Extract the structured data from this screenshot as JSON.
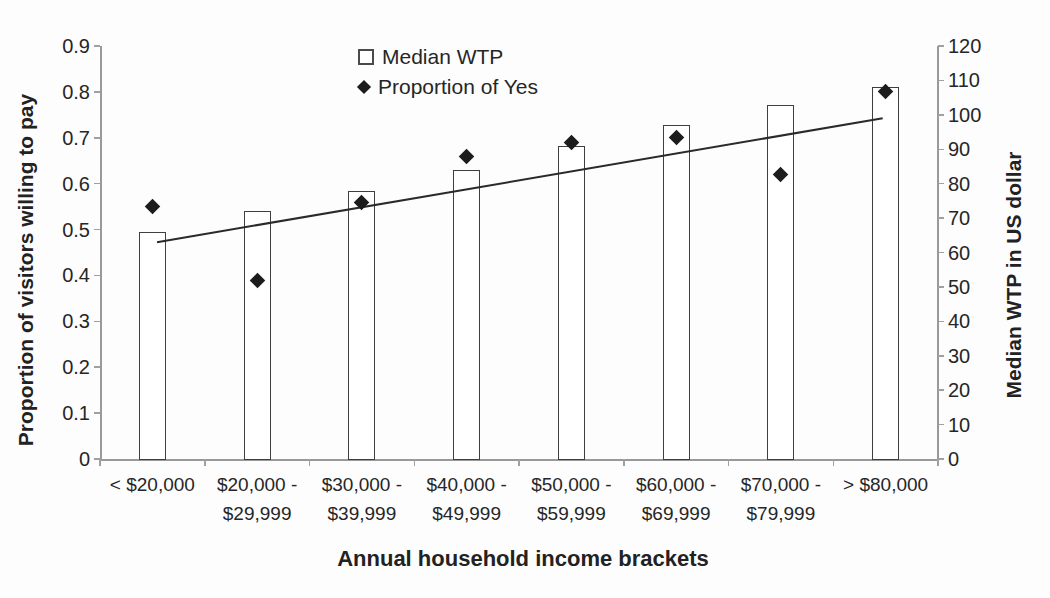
{
  "legend": {
    "items": [
      {
        "marker": "open-square-icon",
        "label": "Median WTP"
      },
      {
        "marker": "filled-diamond-icon",
        "label": "Proportion of Yes"
      }
    ]
  },
  "axes": {
    "left": {
      "title": "Proportion of visitors willing to pay",
      "min": 0,
      "max": 0.9,
      "ticks": [
        "0",
        "0.1",
        "0.2",
        "0.3",
        "0.4",
        "0.5",
        "0.6",
        "0.7",
        "0.8",
        "0.9"
      ]
    },
    "right": {
      "title": "Median WTP in US dollar",
      "min": 0,
      "max": 120,
      "ticks": [
        "0",
        "10",
        "20",
        "30",
        "40",
        "50",
        "60",
        "70",
        "80",
        "90",
        "100",
        "110",
        "120"
      ]
    },
    "x": {
      "title": "Annual household income brackets"
    }
  },
  "chart_data": {
    "type": "bar",
    "categories": [
      "< $20,000",
      "$20,000 - $29,999",
      "$30,000 - $39,999",
      "$40,000 - $49,999",
      "$50,000 - $59,999",
      "$60,000 - $69,999",
      "$70,000 - $79,999",
      "> $80,000"
    ],
    "category_label_lines": [
      [
        "< $20,000"
      ],
      [
        "$20,000 -",
        "$29,999"
      ],
      [
        "$30,000 -",
        "$39,999"
      ],
      [
        "$40,000 -",
        "$49,999"
      ],
      [
        "$50,000 -",
        "$59,999"
      ],
      [
        "$60,000 -",
        "$69,999"
      ],
      [
        "$70,000 -",
        "$79,999"
      ],
      [
        "> $80,000"
      ]
    ],
    "series": [
      {
        "name": "Median WTP",
        "render": "bar",
        "axis": "right",
        "values": [
          66,
          72,
          78,
          84,
          91,
          97,
          103,
          108
        ]
      },
      {
        "name": "Proportion of Yes",
        "render": "scatter",
        "marker": "filled-diamond",
        "axis": "left",
        "values": [
          0.55,
          0.39,
          0.56,
          0.66,
          0.69,
          0.7,
          0.62,
          0.8
        ]
      },
      {
        "name": "Median WTP linear trend",
        "render": "line",
        "axis": "right",
        "points": [
          {
            "x_frac": 0.068,
            "value": 63
          },
          {
            "x_frac": 0.934,
            "value": 99
          }
        ]
      }
    ],
    "title": "",
    "xlabel": "Annual household income brackets",
    "ylabel": "Proportion of visitors willing to pay",
    "ylabel_right": "Median WTP in US dollar",
    "ylim_left": [
      0,
      0.9
    ],
    "ylim_right": [
      0,
      120
    ],
    "grid": false,
    "legend_position": "top-center"
  },
  "colors": {
    "bar_fill": "#ffffff",
    "bar_border": "#3f3f3f",
    "marker": "#1c1c1c",
    "trendline": "#2a2a2a",
    "axis": "#999999",
    "text": "#262626"
  }
}
